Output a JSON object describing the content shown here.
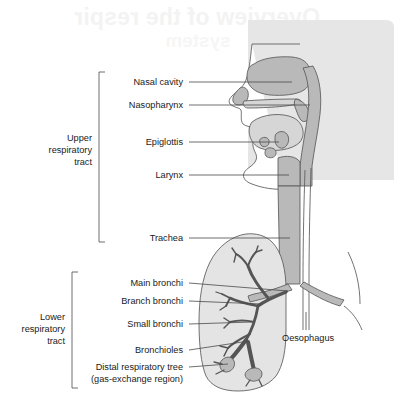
{
  "figure": {
    "ghost_title_line1": "Overview of the respir",
    "ghost_title_line2": "system",
    "background_panel_color": "#e6e6e6",
    "line_color": "#4a4a4a",
    "fill_mid": "#b9b9b9",
    "fill_light": "#d6d6d6"
  },
  "groups": [
    {
      "id": "upper",
      "label_line1": "Upper",
      "label_line2": "respiratory",
      "label_line3": "tract"
    },
    {
      "id": "lower",
      "label_line1": "Lower",
      "label_line2": "respiratory",
      "label_line3": "tract"
    }
  ],
  "labels": {
    "nasal_cavity": "Nasal cavity",
    "nasopharynx": "Nasopharynx",
    "epiglottis": "Epiglottis",
    "larynx": "Larynx",
    "trachea": "Trachea",
    "main_bronchi": "Main bronchi",
    "branch_bronchi": "Branch bronchi",
    "small_bronchi": "Small bronchi",
    "bronchioles": "Bronchioles",
    "distal_tree_line1": "Distal respiratory tree",
    "distal_tree_line2": "(gas-exchange region)",
    "oesophagus": "Oesophagus"
  }
}
